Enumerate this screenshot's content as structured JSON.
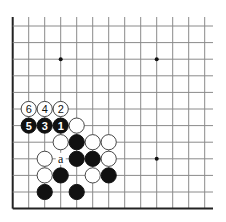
{
  "diagram": {
    "type": "go-board-fragment",
    "visible_edges": [
      "left",
      "bottom"
    ],
    "columns": 13,
    "rows": 12,
    "star_points": [
      [
        3,
        2
      ],
      [
        9,
        2
      ],
      [
        9,
        8
      ]
    ],
    "stones": [
      {
        "col": 1,
        "row": 5,
        "color": "white",
        "label": "6"
      },
      {
        "col": 2,
        "row": 5,
        "color": "white",
        "label": "4"
      },
      {
        "col": 3,
        "row": 5,
        "color": "white",
        "label": "2"
      },
      {
        "col": 1,
        "row": 6,
        "color": "black",
        "label": "5"
      },
      {
        "col": 2,
        "row": 6,
        "color": "black",
        "label": "3"
      },
      {
        "col": 3,
        "row": 6,
        "color": "black",
        "label": "1"
      },
      {
        "col": 4,
        "row": 6,
        "color": "white",
        "label": ""
      },
      {
        "col": 3,
        "row": 7,
        "color": "white",
        "label": ""
      },
      {
        "col": 4,
        "row": 7,
        "color": "black",
        "label": ""
      },
      {
        "col": 5,
        "row": 7,
        "color": "white",
        "label": ""
      },
      {
        "col": 6,
        "row": 7,
        "color": "white",
        "label": ""
      },
      {
        "col": 2,
        "row": 8,
        "color": "white",
        "label": ""
      },
      {
        "col": 4,
        "row": 8,
        "color": "black",
        "label": ""
      },
      {
        "col": 5,
        "row": 8,
        "color": "black",
        "label": ""
      },
      {
        "col": 6,
        "row": 8,
        "color": "white",
        "label": ""
      },
      {
        "col": 2,
        "row": 9,
        "color": "white",
        "label": ""
      },
      {
        "col": 3,
        "row": 9,
        "color": "black",
        "label": ""
      },
      {
        "col": 5,
        "row": 9,
        "color": "white",
        "label": ""
      },
      {
        "col": 6,
        "row": 9,
        "color": "black",
        "label": ""
      },
      {
        "col": 2,
        "row": 10,
        "color": "black",
        "label": ""
      },
      {
        "col": 4,
        "row": 10,
        "color": "black",
        "label": ""
      }
    ],
    "markers": [
      {
        "col": 3,
        "row": 8,
        "label": "a"
      }
    ]
  }
}
